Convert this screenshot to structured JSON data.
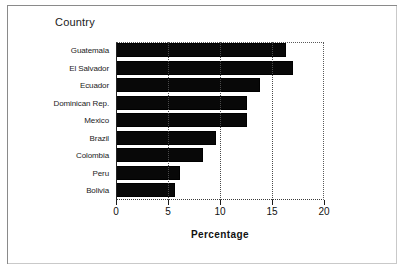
{
  "chart_data": {
    "type": "bar",
    "orientation": "horizontal",
    "title": "",
    "ylabel": "Country",
    "xlabel": "Percentage",
    "categories": [
      "Guatemala",
      "El Salvador",
      "Ecuador",
      "Dominican Rep.",
      "Mexico",
      "Brazil",
      "Colombia",
      "Peru",
      "Bolivia"
    ],
    "values": [
      16.3,
      17.0,
      13.8,
      12.6,
      12.6,
      9.6,
      8.4,
      6.2,
      5.7
    ],
    "xlim": [
      0,
      20
    ],
    "xticks": [
      0,
      5,
      10,
      15,
      20
    ],
    "xticklabels": [
      "0",
      "5",
      "10",
      "15",
      "20"
    ],
    "grid": "vertical-dotted",
    "legend": "none",
    "bar_color": "#080808",
    "background_color": "#ffffff"
  },
  "frame": {
    "border_color": "#8a8a8a"
  }
}
